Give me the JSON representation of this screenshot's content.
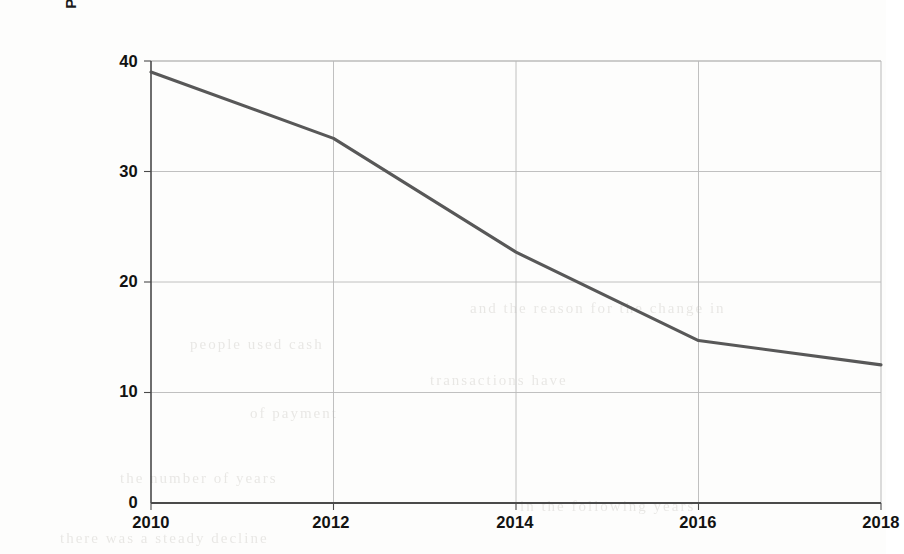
{
  "chart_data": {
    "type": "line",
    "title": "",
    "xlabel": "",
    "ylabel": "Persentage of people who paid in cash",
    "x": [
      2010,
      2012,
      2014,
      2016,
      2018
    ],
    "values": [
      39,
      33,
      22.7,
      14.7,
      12.5
    ],
    "series": [
      {
        "name": "Percentage of people who paid in cash",
        "values": [
          39,
          33,
          22.7,
          14.7,
          12.5
        ]
      }
    ],
    "xlim": [
      2010,
      2018
    ],
    "ylim": [
      0,
      40
    ],
    "x_ticks": [
      "2010",
      "2012",
      "2014",
      "2016",
      "2018"
    ],
    "y_ticks": [
      "0",
      "10",
      "20",
      "30",
      "40"
    ],
    "grid": true,
    "legend": "none",
    "line_color": "#585858",
    "grid_color": "#b9b9b9",
    "axis_color": "#4a4a4a",
    "background_color": "#fdfdfc"
  },
  "axes": {
    "y_title": "Persentage of people who paid in cash",
    "y_ticks": [
      {
        "label": "40",
        "value": 40
      },
      {
        "label": "30",
        "value": 30
      },
      {
        "label": "20",
        "value": 20
      },
      {
        "label": "10",
        "value": 10
      },
      {
        "label": "0",
        "value": 0
      }
    ],
    "x_ticks": [
      {
        "label": "2010",
        "value": 2010
      },
      {
        "label": "2012",
        "value": 2012
      },
      {
        "label": "2014",
        "value": 2014
      },
      {
        "label": "2016",
        "value": 2016
      },
      {
        "label": "2018",
        "value": 2018
      }
    ]
  },
  "page_artifacts": {
    "bleed_through": [
      {
        "text": "and the  reason  for  the  change  in",
        "x": 470,
        "y": 300
      },
      {
        "text": "people  used  cash",
        "x": 190,
        "y": 336
      },
      {
        "text": "transactions   have",
        "x": 430,
        "y": 372
      },
      {
        "text": "of  payment",
        "x": 250,
        "y": 405
      },
      {
        "text": "the  number  of  years",
        "x": 120,
        "y": 470
      },
      {
        "text": "in  the  following  years",
        "x": 520,
        "y": 498
      },
      {
        "text": "there  was  a  steady  decline",
        "x": 60,
        "y": 530
      }
    ]
  }
}
